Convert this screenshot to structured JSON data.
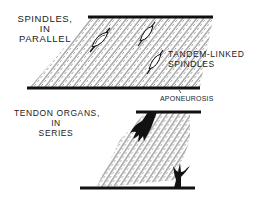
{
  "diagram": {
    "top_panel": {
      "title_lines": [
        "SPINDLES,",
        "IN",
        "PARALLEL"
      ],
      "callout_lines": [
        "TANDEM-LINKED",
        "SPINDLES"
      ],
      "aponeurosis_label": "APONEUROSIS"
    },
    "bottom_panel": {
      "title_lines": [
        "TENDON ORGANS,",
        "IN",
        "SERIES"
      ]
    },
    "colors": {
      "ink": "#111111",
      "background": "#ffffff"
    }
  }
}
